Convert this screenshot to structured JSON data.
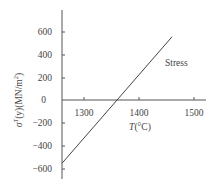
{
  "chart_data": {
    "type": "line",
    "title": "",
    "xlabel": "T(°C)",
    "ylabel": "σT(y)(MN/m2)",
    "ylabel_parts": {
      "sigma": "σ",
      "sup": "T",
      "rest": "(y)(MN/m",
      "unit_sup": "2",
      "close": ")"
    },
    "xlabel_parts": {
      "var": "T",
      "rest": "(°C)"
    },
    "x_ticks": [
      1300,
      1400,
      1500
    ],
    "y_ticks": [
      600,
      400,
      200,
      0,
      -200,
      -400,
      -600
    ],
    "x_tick_labels": [
      "1300",
      "1400",
      "1500"
    ],
    "y_tick_labels": [
      "600",
      "400",
      "200",
      "0",
      "−200",
      "−400",
      "−600"
    ],
    "xlim": [
      1260,
      1525
    ],
    "ylim": [
      -680,
      790
    ],
    "grid": false,
    "legend": "inline label",
    "series": [
      {
        "name": "Stress",
        "x": [
          1260,
          1460
        ],
        "y": [
          -550,
          550
        ],
        "color": "#444444"
      }
    ],
    "annotations": [
      {
        "text": "Stress",
        "x": 1410,
        "y": 380
      }
    ]
  },
  "colors": {
    "axis": "#555555",
    "line": "#444444",
    "text": "#444444"
  }
}
